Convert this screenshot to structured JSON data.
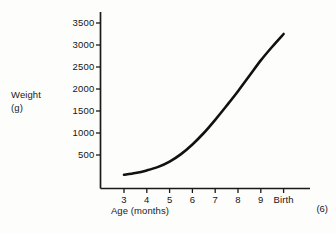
{
  "chart_data": {
    "type": "line",
    "title": "",
    "xlabel": "Age (months)",
    "ylabel": "Weight (g)",
    "ylabel_line1": "Weight",
    "ylabel_line2": "(g)",
    "grid": false,
    "legend": "none",
    "ylim": [
      0,
      3600
    ],
    "yticks": [
      500,
      1000,
      1500,
      2000,
      2500,
      3000,
      3500
    ],
    "ytick_labels": [
      "500",
      "1000",
      "1500",
      "2000",
      "2500",
      "3000",
      "3500"
    ],
    "xticks": [
      3,
      4,
      5,
      6,
      7,
      8,
      9,
      10
    ],
    "xtick_labels": [
      "3",
      "4",
      "5",
      "6",
      "7",
      "8",
      "9",
      "Birth"
    ],
    "series": [
      {
        "name": "Fetal weight",
        "x": [
          3,
          3.5,
          4,
          4.5,
          5,
          5.5,
          6,
          6.5,
          7,
          7.5,
          8,
          8.5,
          9,
          9.5,
          10
        ],
        "values": [
          50,
          90,
          150,
          230,
          350,
          520,
          740,
          1000,
          1300,
          1620,
          1950,
          2300,
          2650,
          2960,
          3250
        ]
      }
    ],
    "line_color": "#111111",
    "line_width": 2.6,
    "axis_color": "#1a1a1a",
    "background": "#fdfdfc"
  },
  "annotations": {
    "page_marker": "(6)"
  }
}
